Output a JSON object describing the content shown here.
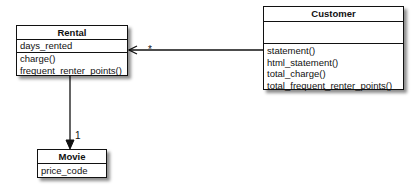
{
  "diagram": {
    "type": "UML class diagram",
    "classes": [
      {
        "name": "Rental",
        "attributes": [
          "days_rented"
        ],
        "methods": [
          "charge()",
          "frequent_renter_points()"
        ]
      },
      {
        "name": "Customer",
        "attributes": [],
        "methods": [
          "statement()",
          "html_statement()",
          "total_charge()",
          "total_frequent_renter_points()"
        ]
      },
      {
        "name": "Movie",
        "attributes": [
          "price_code"
        ],
        "methods": []
      }
    ],
    "associations": [
      {
        "from": "Customer",
        "to": "Rental",
        "multiplicity": "*"
      },
      {
        "from": "Rental",
        "to": "Movie",
        "multiplicity": "1"
      }
    ]
  }
}
